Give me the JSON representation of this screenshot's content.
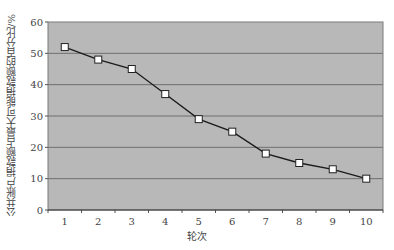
{
  "chart_data": {
    "type": "line",
    "title": "",
    "xlabel": "轮次",
    "ylabel": "公共账户捐款额占最大可能捐款额的百分比/%",
    "categories": [
      "1",
      "2",
      "3",
      "4",
      "5",
      "6",
      "7",
      "8",
      "9",
      "10"
    ],
    "x": [
      1,
      2,
      3,
      4,
      5,
      6,
      7,
      8,
      9,
      10
    ],
    "values": [
      52,
      48,
      45,
      37,
      29,
      25,
      18,
      15,
      13,
      10
    ],
    "ylim": [
      0,
      60
    ],
    "yticks": [
      0,
      10,
      20,
      30,
      40,
      50,
      60
    ],
    "grid": true,
    "legend": null,
    "marker": "square",
    "colors": {
      "plot_background": "#b8b8b8",
      "gridline": "#6f6f6f",
      "line": "#1a1a1a",
      "marker_fill": "#ffffff"
    }
  }
}
